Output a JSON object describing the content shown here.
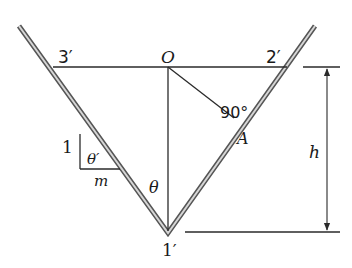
{
  "diagram": {
    "labels": {
      "point_3p": "3′",
      "point_O": "O",
      "point_2p": "2′",
      "point_A": "A",
      "point_1p": "1′",
      "angle_right": "90°",
      "angle_theta": "θ",
      "angle_theta_prime": "θ′",
      "slope_rise": "1",
      "slope_run": "m",
      "depth": "h"
    },
    "colors": {
      "line": "#2a2a2a",
      "wall_outer": "#555555",
      "wall_inner": "#d0d0d0",
      "background": "#ffffff"
    }
  }
}
